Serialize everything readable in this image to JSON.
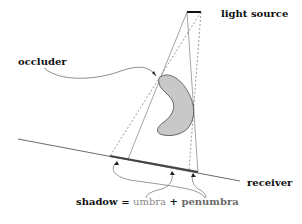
{
  "labels": {
    "light_source": "light source",
    "occluder": "occluder",
    "receiver": "receiver",
    "shadow_equation": {
      "shadow": "shadow",
      "equals": " = ",
      "umbra": "umbra",
      "plus": " + ",
      "penumbra": "penumbra"
    }
  },
  "colors": {
    "line": "#333333",
    "occluder_fill": "#c8c8c8",
    "shadow_band": "#444444",
    "umbra_text": "#8a8a8a",
    "penumbra_text": "#6a6a6a"
  }
}
